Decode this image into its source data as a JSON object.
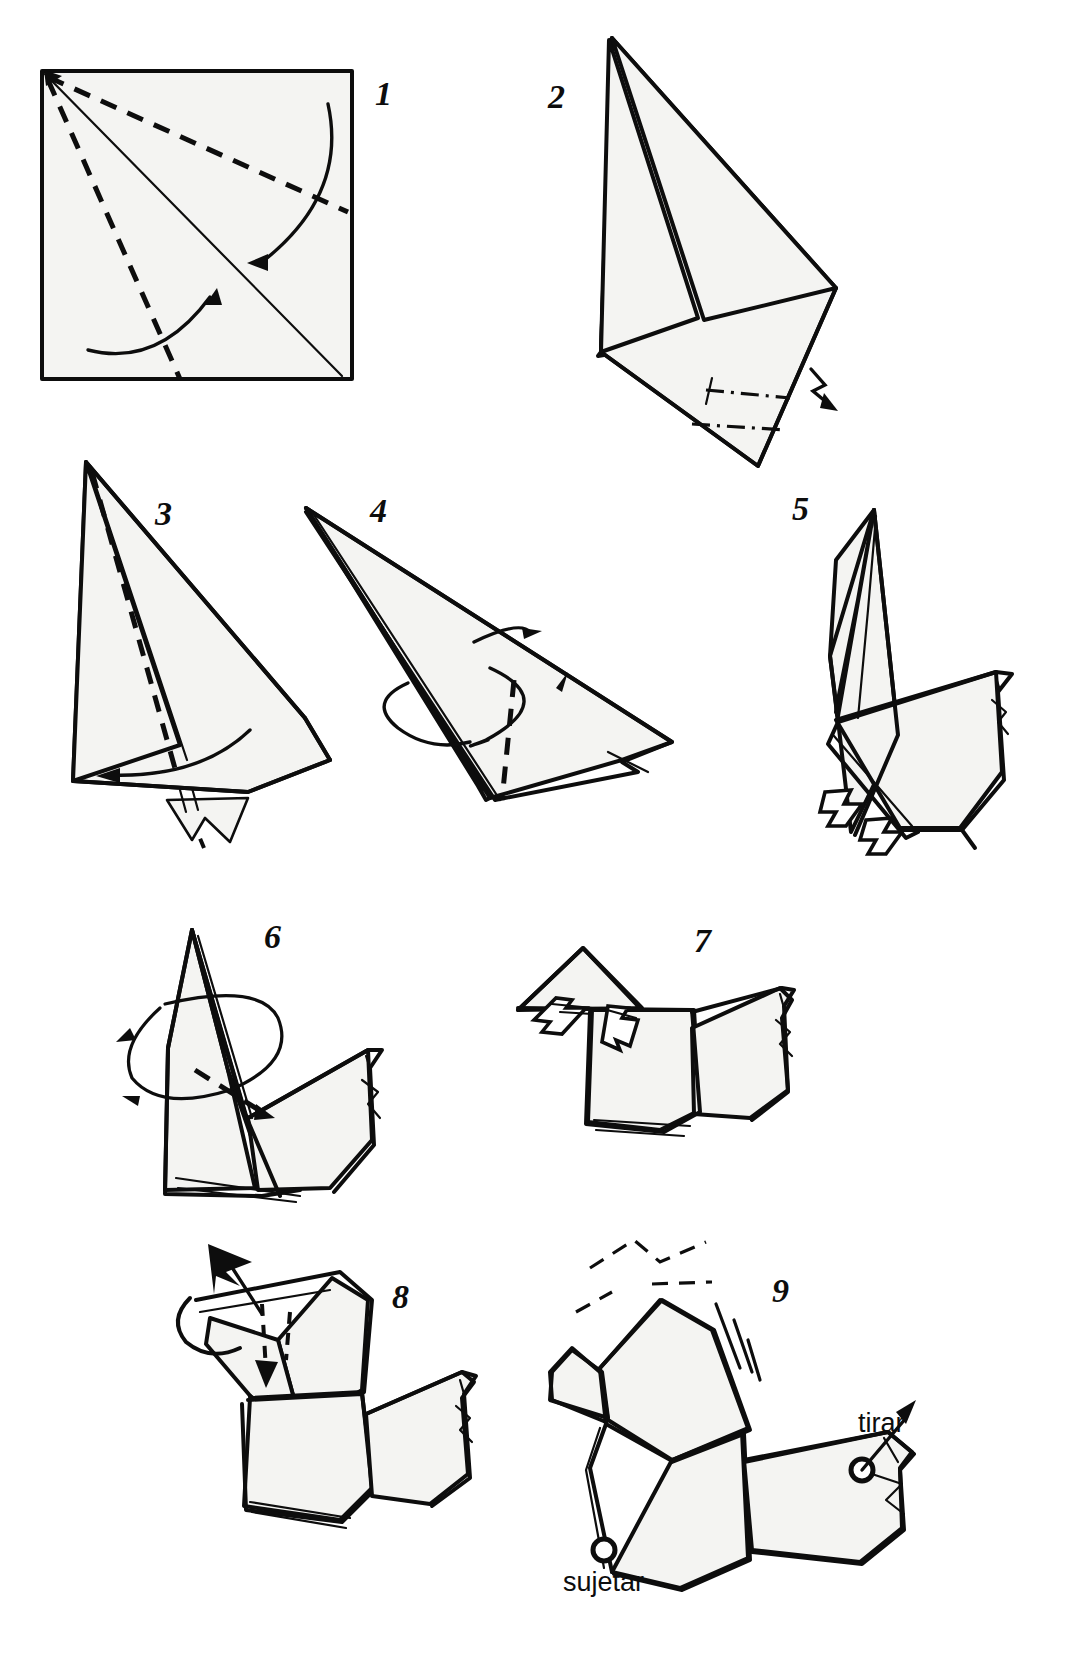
{
  "document": {
    "type": "origami-instruction-diagram",
    "language": "es",
    "title": "",
    "page_width": 1091,
    "page_height": 1667,
    "background_color": "#ffffff",
    "line_color": "#0d0d0d",
    "paper_fill_color": "#f4f4f2"
  },
  "steps": [
    {
      "id": "step-1",
      "number": "1",
      "number_x": 375,
      "number_y": 105,
      "description": "Square sheet with diagonal crease and two dashed valley folds from top-left corner; two curved fold arrows",
      "shape": "square"
    },
    {
      "id": "step-2",
      "number": "2",
      "number_x": 560,
      "number_y": 105,
      "description": "Kite shape folded to a tall triangle, lightning-bolt arrow at lower right indicating turn / fold back",
      "shape": "kite-triangle"
    },
    {
      "id": "step-3",
      "number": "3",
      "number_x": 165,
      "number_y": 518,
      "description": "Tall triangle with vertical dashed valley crease and small pleat at the bottom",
      "shape": "tall-triangle"
    },
    {
      "id": "step-4",
      "number": "4",
      "number_x": 382,
      "number_y": 515,
      "description": "Sideways narrow triangle with vertical dashed crease and a rotate-around arrow",
      "shape": "narrow-triangle"
    },
    {
      "id": "step-5",
      "number": "5",
      "number_x": 802,
      "number_y": 512,
      "description": "Bird base starting to take shape with two white open arrows pulling the lower flaps down",
      "shape": "bird-body"
    },
    {
      "id": "step-6",
      "number": "6",
      "number_x": 276,
      "number_y": 940,
      "description": "Bird form with a looping rotation arrow around the neck and a dashed valley crease",
      "shape": "bird-body"
    },
    {
      "id": "step-7",
      "number": "7",
      "number_x": 705,
      "number_y": 940,
      "description": "Bird with flat head flap and two white open arrows pushing it open",
      "shape": "bird-head-open"
    },
    {
      "id": "step-8",
      "number": "8",
      "number_x": 405,
      "number_y": 1298,
      "description": "Bird with beak formed, solid black arrow pressing the head down and dashed fold guides",
      "shape": "bird-final"
    },
    {
      "id": "step-9",
      "number": "9",
      "number_x": 783,
      "number_y": 1290,
      "description": "Finished flapping bird; pull the tail and hold the chest to make the head move",
      "shape": "bird-action"
    }
  ],
  "captions": [
    {
      "id": "caption-tirar",
      "text": "tirar",
      "x": 858,
      "y": 1432,
      "meaning": "pull",
      "attached_to": "step-9"
    },
    {
      "id": "caption-sujetar",
      "text": "sujetar",
      "x": 563,
      "y": 1591,
      "meaning": "hold",
      "attached_to": "step-9"
    }
  ],
  "legend": {
    "valley_fold": "dashed line",
    "mountain_fold": "dash-dot line",
    "solid_arrow": "fold direction",
    "open_white_arrow": "pull / open out",
    "lightning_arrow": "fold and tuck",
    "circle_marker": "grip point"
  }
}
